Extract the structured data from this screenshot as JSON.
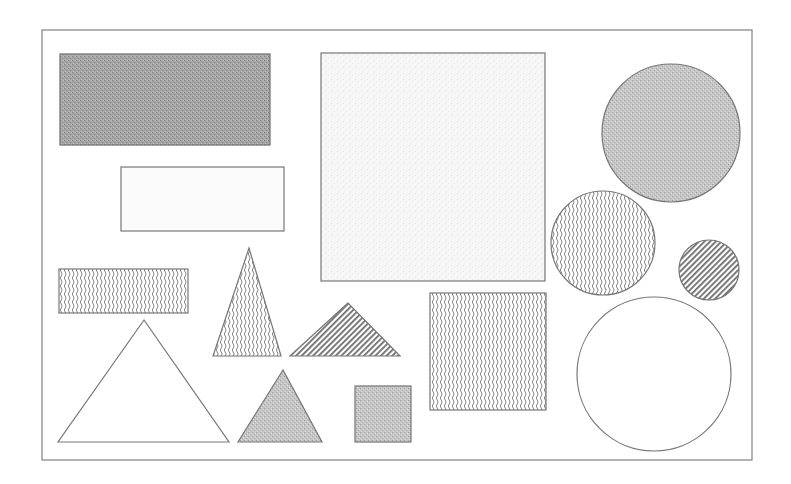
{
  "figure": {
    "frame": {
      "x": 42,
      "y": 30,
      "w": 710,
      "h": 430
    },
    "colors": {
      "stroke": "#6b6b6b",
      "gray_dark": "#9a9a9a",
      "gray_light": "#c8c8c8",
      "stipple_light": "#f2f2f2",
      "background": "#ffffff"
    },
    "shapes": [
      {
        "id": "rect-dark-gray",
        "type": "rect",
        "fill": "gray-dark",
        "x": 60,
        "y": 54,
        "w": 210,
        "h": 91
      },
      {
        "id": "rect-blank",
        "type": "rect",
        "fill": "blank",
        "x": 121,
        "y": 167,
        "w": 163,
        "h": 64
      },
      {
        "id": "square-large-light",
        "type": "rect",
        "fill": "light-stipple",
        "x": 321,
        "y": 53,
        "w": 224,
        "h": 228
      },
      {
        "id": "circle-gray",
        "type": "circle",
        "fill": "gray-light",
        "cx": 671,
        "cy": 133,
        "r": 69
      },
      {
        "id": "circle-wavy",
        "type": "circle",
        "fill": "wavy",
        "cx": 603,
        "cy": 243,
        "r": 52
      },
      {
        "id": "circle-striped",
        "type": "circle",
        "fill": "stripes",
        "cx": 709,
        "cy": 270,
        "r": 30
      },
      {
        "id": "circle-blank",
        "type": "circle",
        "fill": "blank",
        "cx": 654,
        "cy": 374,
        "r": 77
      },
      {
        "id": "rect-wavy",
        "type": "rect",
        "fill": "wavy",
        "x": 59,
        "y": 269,
        "w": 129,
        "h": 44
      },
      {
        "id": "triangle-tall-wavy",
        "type": "polygon",
        "fill": "wavy",
        "points": "249,248 213,356 281,356"
      },
      {
        "id": "triangle-striped",
        "type": "polygon",
        "fill": "stripes",
        "points": "348,303 290,356 400,356"
      },
      {
        "id": "triangle-large-blank",
        "type": "polygon",
        "fill": "blank",
        "points": "144,320 58,442 229,442"
      },
      {
        "id": "triangle-gray",
        "type": "polygon",
        "fill": "gray-light",
        "points": "283,370 238,442 322,442"
      },
      {
        "id": "square-small-gray",
        "type": "rect",
        "fill": "gray-light",
        "x": 355,
        "y": 386,
        "w": 56,
        "h": 56
      },
      {
        "id": "square-wavy",
        "type": "rect",
        "fill": "wavy",
        "x": 430,
        "y": 293,
        "w": 116,
        "h": 117
      }
    ]
  }
}
